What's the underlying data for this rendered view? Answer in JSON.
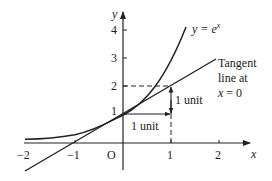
{
  "diagram": {
    "type": "function-graph",
    "axes": {
      "x_label": "x",
      "y_label": "y",
      "origin_label": "O",
      "x_ticks": [
        "−2",
        "−1",
        "1",
        "2"
      ],
      "y_ticks": [
        "1",
        "2",
        "3",
        "4"
      ],
      "x_range": [
        -2,
        2.5
      ],
      "y_range": [
        0,
        4.7
      ]
    },
    "curve": {
      "label_prefix": "y = e",
      "label_exponent": "x",
      "function": "e^x"
    },
    "tangent": {
      "line1": "Tangent",
      "line2": "line at",
      "line3_var": "x",
      "line3_rest": " = 0",
      "equation": "y = x + 1"
    },
    "annotations": {
      "horizontal_unit": "1 unit",
      "vertical_unit": "1 unit"
    },
    "colors": {
      "stroke": "#222222",
      "background": "#ffffff"
    }
  }
}
